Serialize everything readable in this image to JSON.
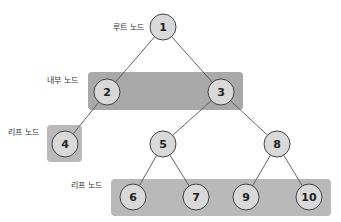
{
  "diagram": {
    "type": "binary-tree",
    "colors": {
      "node_fill": "#d9d9d9",
      "node_stroke": "#444444",
      "edge": "#555555",
      "internal_box": "#a9a9a9",
      "leaf_box": "#b9b9b9"
    },
    "labels": {
      "root": "루트 노드",
      "internal": "내부 노드",
      "leaf_left": "리프 노드",
      "leaf_bottom": "리프 노드"
    },
    "nodes": [
      {
        "id": "1",
        "label": "1",
        "x": 163,
        "y": 27,
        "kind": "root"
      },
      {
        "id": "2",
        "label": "2",
        "x": 107,
        "y": 92,
        "kind": "internal"
      },
      {
        "id": "3",
        "label": "3",
        "x": 221,
        "y": 92,
        "kind": "internal"
      },
      {
        "id": "4",
        "label": "4",
        "x": 65,
        "y": 144,
        "kind": "leaf"
      },
      {
        "id": "5",
        "label": "5",
        "x": 163,
        "y": 144,
        "kind": "internal"
      },
      {
        "id": "8",
        "label": "8",
        "x": 277,
        "y": 144,
        "kind": "internal"
      },
      {
        "id": "6",
        "label": "6",
        "x": 133,
        "y": 197,
        "kind": "leaf"
      },
      {
        "id": "7",
        "label": "7",
        "x": 196,
        "y": 197,
        "kind": "leaf"
      },
      {
        "id": "9",
        "label": "9",
        "x": 246,
        "y": 197,
        "kind": "leaf"
      },
      {
        "id": "10",
        "label": "10",
        "x": 309,
        "y": 197,
        "kind": "leaf"
      }
    ],
    "edges": [
      [
        "1",
        "2"
      ],
      [
        "1",
        "3"
      ],
      [
        "2",
        "4"
      ],
      [
        "3",
        "5"
      ],
      [
        "3",
        "8"
      ],
      [
        "5",
        "6"
      ],
      [
        "5",
        "7"
      ],
      [
        "8",
        "9"
      ],
      [
        "8",
        "10"
      ]
    ]
  }
}
